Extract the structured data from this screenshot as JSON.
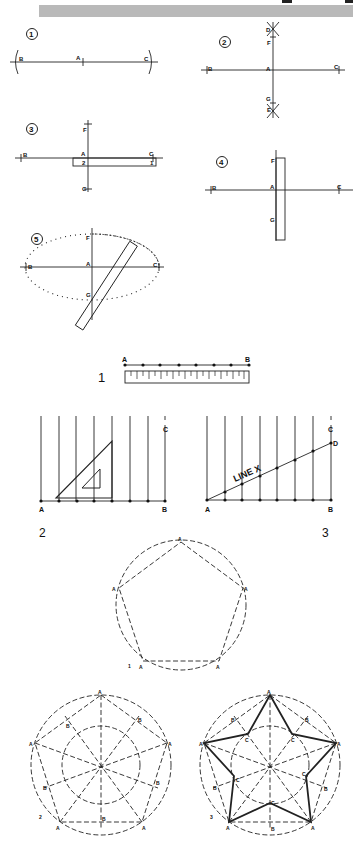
{
  "header": {
    "banner_color": "#b9b9b9"
  },
  "fig1": {
    "steps": [
      {
        "number": "1",
        "labels": {
          "b": "B",
          "a": "A",
          "c": "C"
        }
      },
      {
        "number": "2",
        "labels": {
          "b": "B",
          "a": "A",
          "c": "C",
          "d": "D",
          "f": "F",
          "g": "G",
          "e": "E"
        }
      },
      {
        "number": "3",
        "labels": {
          "b": "B",
          "a": "A",
          "c": "C",
          "f": "F",
          "g": "G",
          "m2": "2",
          "m1": "1"
        }
      },
      {
        "number": "4",
        "labels": {
          "b": "B",
          "a": "A",
          "c": "C",
          "f": "F",
          "g": "G",
          "m1": "1",
          "m2": "3",
          "m3": "2"
        }
      },
      {
        "number": "5",
        "labels": {
          "b": "B",
          "a": "A",
          "c": "C",
          "f": "F",
          "g": "G",
          "m1": "1",
          "m2": "3",
          "m3": "2"
        }
      }
    ]
  },
  "fig2": {
    "panel1": {
      "number": "1",
      "a": "A",
      "b": "B"
    },
    "panel2": {
      "number": "2",
      "a": "A",
      "b": "B",
      "c": "C"
    },
    "panel3": {
      "number": "3",
      "a": "A",
      "b": "B",
      "c": "C",
      "d": "D",
      "line_label": "LINE X"
    }
  },
  "fig3": {
    "pentagon1": {
      "number": "1",
      "vertex": "A"
    },
    "pentagon2": {
      "number": "2",
      "vertex": "A",
      "mid": "B"
    },
    "pentagon3": {
      "number": "3",
      "vertex": "A",
      "mid": "B",
      "inner": "C"
    }
  }
}
